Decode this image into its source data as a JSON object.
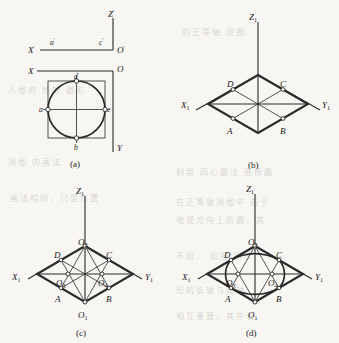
{
  "figure": {
    "background_color": "#f7f6f3",
    "ink_color": "#2a2a2a",
    "panels": [
      {
        "id": "a",
        "caption": "(a)",
        "description": "Orthographic views: front view line with a' and c', top view circle inscribed in square with a, b, c, d",
        "axes": [
          {
            "name": "X'",
            "label": "X'"
          },
          {
            "name": "Z'",
            "label": "Z'"
          },
          {
            "name": "O'",
            "label": "O'"
          },
          {
            "name": "X",
            "label": "X"
          },
          {
            "name": "O",
            "label": "O"
          },
          {
            "name": "Y",
            "label": "Y"
          }
        ],
        "points": [
          {
            "label": "a'",
            "view": "front"
          },
          {
            "label": "c'",
            "view": "front"
          },
          {
            "label": "a",
            "view": "top"
          },
          {
            "label": "b",
            "view": "top"
          },
          {
            "label": "c",
            "view": "top"
          },
          {
            "label": "d",
            "view": "top"
          }
        ]
      },
      {
        "id": "b",
        "caption": "(b)",
        "description": "Isometric axes with rhombus (isometric square) and midpoints A, B, C, D",
        "axes": [
          {
            "name": "Z1",
            "label": "Z",
            "sub": "1"
          },
          {
            "name": "X1",
            "label": "X",
            "sub": "1"
          },
          {
            "name": "Y1",
            "label": "Y",
            "sub": "1"
          }
        ],
        "points": [
          {
            "label": "A"
          },
          {
            "label": "B"
          },
          {
            "label": "C"
          },
          {
            "label": "D"
          }
        ]
      },
      {
        "id": "c",
        "caption": "(c)",
        "description": "Four arc centers located: O1, O2 at obtuse vertices and O3, O4 on the diagonals; construction lines drawn to A, B, C, D",
        "axes": [
          {
            "name": "Z1",
            "label": "Z",
            "sub": "1"
          },
          {
            "name": "X1",
            "label": "X",
            "sub": "1"
          },
          {
            "name": "Y1",
            "label": "Y",
            "sub": "1"
          }
        ],
        "points": [
          {
            "label": "A"
          },
          {
            "label": "B"
          },
          {
            "label": "C"
          },
          {
            "label": "D"
          },
          {
            "label": "O",
            "sub": "1"
          },
          {
            "label": "O",
            "sub": "2"
          },
          {
            "label": "O",
            "sub": "3"
          },
          {
            "label": "O",
            "sub": "4"
          }
        ]
      },
      {
        "id": "d",
        "caption": "(d)",
        "description": "Completed four-center approximate ellipse inscribed in the rhombus",
        "axes": [
          {
            "name": "Z1",
            "label": "Z",
            "sub": "1"
          },
          {
            "name": "X1",
            "label": "X",
            "sub": "1"
          },
          {
            "name": "Y1",
            "label": "Y",
            "sub": "1"
          }
        ],
        "points": [
          {
            "label": "A"
          },
          {
            "label": "B"
          },
          {
            "label": "C"
          },
          {
            "label": "D"
          },
          {
            "label": "O",
            "sub": "1"
          },
          {
            "label": "O",
            "sub": "2"
          },
          {
            "label": "O",
            "sub": "3"
          },
          {
            "label": "O",
            "sub": "4"
          }
        ]
      }
    ]
  },
  "labels": {
    "panel_a": {
      "X_prime": "X",
      "X_prime_tick": "'",
      "Z_prime": "Z",
      "Z_prime_tick": "'",
      "O_prime": "O",
      "O_prime_tick": "'",
      "X": "X",
      "O": "O",
      "Y": "Y",
      "a_prime": "a",
      "a_prime_tick": "'",
      "c_prime": "c",
      "c_prime_tick": "'",
      "a": "a",
      "b": "b",
      "c": "c",
      "d": "d",
      "caption": "(a)"
    },
    "panel_b": {
      "Z": "Z",
      "Z_sub": "1",
      "X": "X",
      "X_sub": "1",
      "Y": "Y",
      "Y_sub": "1",
      "A": "A",
      "B": "B",
      "C": "C",
      "D": "D",
      "caption": "(b)"
    },
    "panel_c": {
      "Z": "Z",
      "Z_sub": "1",
      "X": "X",
      "X_sub": "1",
      "Y": "Y",
      "Y_sub": "1",
      "A": "A",
      "B": "B",
      "C": "C",
      "D": "D",
      "O": "O",
      "O1_sub": "1",
      "O2_sub": "2",
      "O3_sub": "3",
      "O4_sub": "4",
      "caption": "(c)"
    },
    "panel_d": {
      "Z": "Z",
      "Z_sub": "1",
      "X": "X",
      "X_sub": "1",
      "Y": "Y",
      "Y_sub": "1",
      "A": "A",
      "B": "B",
      "C": "C",
      "D": "D",
      "O": "O",
      "O1_sub": "1",
      "O2_sub": "2",
      "O3_sub": "3",
      "O4_sub": "4",
      "caption": "(d)"
    }
  }
}
